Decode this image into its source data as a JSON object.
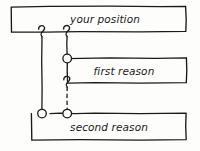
{
  "diagram": {
    "style": "hand-drawn",
    "width": 200,
    "height": 151,
    "background_color": "#fdfdfc",
    "stroke_color": "#1a1a1a",
    "boxes": [
      {
        "id": "your-position",
        "label": "your position",
        "x": 11,
        "y": 6,
        "width": 175,
        "height": 26,
        "label_x": 105,
        "label_y": 23
      },
      {
        "id": "first-reason",
        "label": "first reason",
        "x": 67,
        "y": 58,
        "width": 120,
        "height": 25,
        "label_x": 124,
        "label_y": 75
      },
      {
        "id": "second-reason",
        "label": "second reason",
        "x": 31,
        "y": 113,
        "width": 155,
        "height": 27,
        "label_x": 109,
        "label_y": 131
      }
    ],
    "connectors": [
      {
        "id": "position-to-second-reason",
        "line_style": "solid",
        "from_box": "your-position",
        "to_box": "second-reason",
        "x": 42,
        "top_y": 32,
        "bottom_y": 113,
        "start_marker": "hook",
        "end_marker": "circle"
      },
      {
        "id": "position-to-first-reason",
        "line_style": "solid",
        "from_box": "your-position",
        "to_box": "first-reason",
        "x": 67,
        "top_y": 32,
        "bottom_y": 58,
        "start_marker": "hook",
        "end_marker": "circle"
      },
      {
        "id": "first-reason-to-second-reason",
        "line_style": "dashed",
        "from_box": "first-reason",
        "to_box": "second-reason",
        "x": 67,
        "top_y": 83,
        "bottom_y": 113,
        "start_marker": "hook",
        "end_marker": "circle"
      }
    ]
  }
}
